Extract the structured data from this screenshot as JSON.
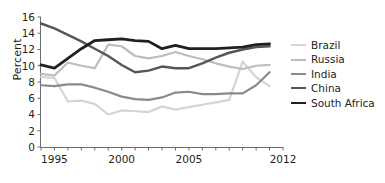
{
  "chart_data": {
    "type": "line",
    "title": "",
    "xlabel": "",
    "ylabel": "Percent",
    "xlim": [
      1994,
      2012
    ],
    "ylim": [
      0,
      16
    ],
    "yticks": [
      0,
      2,
      4,
      6,
      8,
      10,
      12,
      14,
      16
    ],
    "xticks": [
      1995,
      2000,
      2005,
      2012
    ],
    "xtick_minor": [
      1994,
      1995,
      1996,
      1997,
      1998,
      1999,
      2000,
      2001,
      2002,
      2003,
      2004,
      2005,
      2006,
      2007,
      2008,
      2009,
      2010,
      2011,
      2012
    ],
    "grid": false,
    "legend_position": "right",
    "x": [
      1994,
      1995,
      1996,
      1997,
      1998,
      1999,
      2000,
      2001,
      2002,
      2003,
      2004,
      2005,
      2006,
      2007,
      2008,
      2009,
      2010,
      2011
    ],
    "series": [
      {
        "name": "Brazil",
        "color": "#d4d4d4",
        "width": 2.2,
        "values": [
          8.6,
          8.5,
          5.6,
          5.7,
          5.3,
          4.0,
          4.5,
          4.4,
          4.3,
          5.0,
          4.6,
          4.9,
          5.2,
          5.5,
          5.8,
          10.5,
          8.6,
          7.5
        ]
      },
      {
        "name": "Russia",
        "color": "#bdbdbd",
        "width": 2.2,
        "values": [
          9.0,
          8.8,
          10.4,
          10.0,
          9.7,
          12.6,
          12.4,
          11.2,
          10.9,
          11.2,
          11.7,
          11.2,
          10.8,
          10.3,
          9.9,
          9.6,
          10.0,
          10.1
        ]
      },
      {
        "name": "India",
        "color": "#8a8a8a",
        "width": 2.2,
        "values": [
          7.6,
          7.5,
          7.7,
          7.7,
          7.3,
          6.8,
          6.2,
          5.9,
          5.8,
          6.1,
          6.7,
          6.8,
          6.5,
          6.5,
          6.6,
          6.6,
          7.6,
          9.2
        ]
      },
      {
        "name": "China",
        "color": "#565656",
        "width": 2.4,
        "values": [
          15.2,
          14.6,
          13.8,
          13.0,
          12.1,
          11.2,
          10.1,
          9.2,
          9.4,
          9.9,
          9.7,
          9.7,
          10.3,
          11.0,
          11.6,
          12.0,
          12.3,
          12.4
        ]
      },
      {
        "name": "South Africa",
        "color": "#231f20",
        "width": 2.8,
        "values": [
          10.1,
          9.7,
          10.9,
          12.1,
          13.1,
          13.2,
          13.3,
          13.1,
          13.0,
          12.1,
          12.5,
          12.1,
          12.1,
          12.1,
          12.2,
          12.3,
          12.6,
          12.7
        ]
      }
    ]
  },
  "legend": {
    "items": [
      {
        "label": "Brazil"
      },
      {
        "label": "Russia"
      },
      {
        "label": "India"
      },
      {
        "label": "China"
      },
      {
        "label": "South Africa"
      }
    ]
  },
  "axes": {
    "y_title": "Percent",
    "axis_color": "#6d6d6d"
  }
}
